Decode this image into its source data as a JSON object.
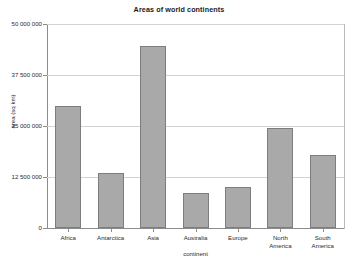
{
  "chart_data": {
    "type": "bar",
    "title": "Areas of world continents",
    "xlabel": "continent",
    "ylabel": "area (sq km)",
    "categories": [
      "Africa",
      "Antarctica",
      "Asia",
      "Australia",
      "Europe",
      "North\nAmerica",
      "South\nAmerica"
    ],
    "values": [
      30000000,
      13500000,
      44500000,
      8500000,
      10000000,
      24500000,
      17800000
    ],
    "ylim": [
      0,
      50000000
    ],
    "yticks": [
      0,
      12500000,
      25000000,
      37500000,
      50000000
    ],
    "ytick_labels": [
      "0",
      "12 500 000",
      "25 000 000",
      "37 500 000",
      "50 000 000"
    ],
    "grid": true,
    "legend": false,
    "bar_color": "#a9a9a9",
    "bar_border_color": "#7d7d7d",
    "grid_color": "#d2d2d2",
    "axis_color": "#8c8c8c"
  }
}
